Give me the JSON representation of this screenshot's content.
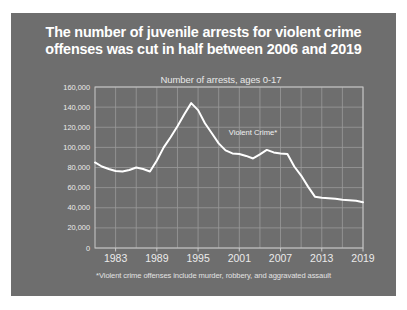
{
  "figure": {
    "background_color": "#ffffff",
    "panel_color": "#6e6e6e",
    "title": "The number of juvenile arrests for violent crime\noffenses was cut in half between 2006 and 2019",
    "subtitle": "Number of arrests, ages 0-17",
    "footnote": "*Violent crime offenses include murder, robbery, and aggravated assault"
  },
  "chart_data": {
    "type": "line",
    "title": "The number of juvenile arrests for violent crime offenses was cut in half between 2006 and 2019",
    "subtitle": "Number of arrests, ages 0-17",
    "xlabel": "",
    "ylabel": "Number of arrests, ages 0-17",
    "xlim": [
      1980,
      2019
    ],
    "ylim": [
      0,
      160000
    ],
    "grid": true,
    "legend": "none",
    "line_color": "#ffffff",
    "annotations": [
      {
        "text": "Violent Crime*",
        "x": 2003,
        "y": 112000
      }
    ],
    "ytick_labels": [
      "0",
      "20,000",
      "40,000",
      "60,000",
      "80,000",
      "100,000",
      "120,000",
      "140,000",
      "160,000"
    ],
    "ytick_values": [
      0,
      20000,
      40000,
      60000,
      80000,
      100000,
      120000,
      140000,
      160000
    ],
    "xtick_labels": [
      "1983",
      "1989",
      "1995",
      "2001",
      "2007",
      "2013",
      "2019"
    ],
    "xtick_values": [
      1983,
      1989,
      1995,
      2001,
      2007,
      2013,
      2019
    ],
    "x": [
      1980,
      1981,
      1982,
      1983,
      1984,
      1985,
      1986,
      1987,
      1988,
      1989,
      1990,
      1991,
      1992,
      1993,
      1994,
      1995,
      1996,
      1997,
      1998,
      1999,
      2000,
      2001,
      2002,
      2003,
      2004,
      2005,
      2006,
      2007,
      2008,
      2009,
      2010,
      2011,
      2012,
      2013,
      2014,
      2015,
      2016,
      2017,
      2018,
      2019
    ],
    "series": [
      {
        "name": "Violent Crime*",
        "values": [
          85000,
          81000,
          78500,
          76500,
          76000,
          77500,
          80000,
          78500,
          76000,
          87000,
          100000,
          110000,
          121000,
          133000,
          144000,
          137000,
          124000,
          114000,
          104000,
          97000,
          94000,
          93500,
          91500,
          89000,
          93000,
          97500,
          95000,
          94000,
          93500,
          81000,
          72000,
          61000,
          51000,
          50000,
          49500,
          49000,
          48000,
          47500,
          47000,
          45500
        ]
      }
    ]
  }
}
